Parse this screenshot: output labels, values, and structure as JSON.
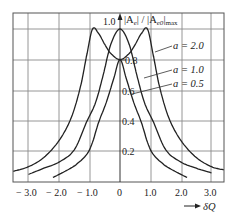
{
  "chart_data": {
    "type": "line",
    "title": "",
    "xlabel": "δQ",
    "ylabel": "|A_e| / |A_e0|max",
    "xlim": [
      -3.5,
      3.4
    ],
    "ylim": [
      0,
      1.1
    ],
    "grid": true,
    "x_ticks": [
      "-3.0",
      "-2.0",
      "-1.0",
      "0",
      "1.0",
      "2.0",
      "3.0"
    ],
    "y_ticks": [
      "0.2",
      "0.4",
      "0.6",
      "0.8",
      "1.0"
    ],
    "series": [
      {
        "name": "a = 2.0",
        "x": [
          -3.5,
          -3.0,
          -2.5,
          -2.0,
          -1.6,
          -1.3,
          -1.1,
          -0.9,
          -0.7,
          -0.5,
          -0.3,
          0,
          0.3,
          0.5,
          0.7,
          0.9,
          1.1,
          1.3,
          1.6,
          2.0,
          2.5,
          3.0,
          3.4
        ],
        "values": [
          0.07,
          0.1,
          0.16,
          0.27,
          0.42,
          0.62,
          0.82,
          1.0,
          0.97,
          0.9,
          0.84,
          0.8,
          0.84,
          0.9,
          0.97,
          1.0,
          0.82,
          0.62,
          0.42,
          0.27,
          0.16,
          0.1,
          0.08
        ]
      },
      {
        "name": "a = 1.0",
        "x": [
          -3.0,
          -2.5,
          -2.0,
          -1.5,
          -1.1,
          -0.8,
          -0.55,
          -0.3,
          0,
          0.3,
          0.55,
          0.8,
          1.1,
          1.5,
          2.0,
          2.5,
          3.0
        ],
        "values": [
          0.05,
          0.09,
          0.13,
          0.21,
          0.39,
          0.52,
          0.7,
          0.9,
          1.0,
          0.9,
          0.7,
          0.52,
          0.39,
          0.21,
          0.13,
          0.09,
          0.06
        ]
      },
      {
        "name": "a = 0.5",
        "x": [
          -2.2,
          -1.8,
          -1.4,
          -1.0,
          -0.7,
          -0.45,
          -0.2,
          0,
          0.2,
          0.45,
          0.7,
          1.0,
          1.4,
          1.8,
          2.2
        ],
        "values": [
          0.03,
          0.07,
          0.12,
          0.21,
          0.39,
          0.52,
          0.68,
          0.8,
          0.68,
          0.52,
          0.39,
          0.21,
          0.12,
          0.07,
          0.03
        ]
      }
    ],
    "annotations": [
      "a = 2.0",
      "a = 1.0",
      "a = 0.5"
    ],
    "legend_position": "inline labels right of center"
  },
  "labels": {
    "ylabel_prefix": "1.0",
    "ylabel_main": "|A",
    "ylabel_sub_e": "e",
    "ylabel_mid": "| / |A",
    "ylabel_sub_e0": "e0",
    "ylabel_end": "|",
    "ylabel_max": "max",
    "xlabel": "δQ",
    "series_a2": "a = 2.0",
    "series_a1": "a = 1.0",
    "series_a05": "a = 0.5",
    "y08": "0.8",
    "y06": "0.6",
    "y04": "0.4",
    "y02": "0.2",
    "xm3": "− 3.0",
    "xm2": "− 2.0",
    "xm1": "− 1.0",
    "x0": "0",
    "x1": "1.0",
    "x2": "2.0",
    "x3": "3.0"
  }
}
